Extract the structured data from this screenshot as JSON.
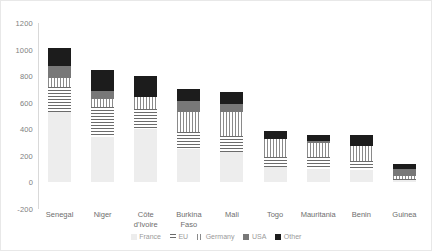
{
  "chart_data": {
    "type": "bar",
    "subtype": "stacked-bar",
    "title": "",
    "xlabel": "",
    "ylabel": "",
    "ylim": [
      -200,
      1200
    ],
    "yticks": [
      1200,
      1000,
      800,
      600,
      400,
      200,
      0,
      -200
    ],
    "grid": false,
    "legend_position": "bottom",
    "categories": [
      "Senegal",
      "Niger",
      "Côte d'Ivoire",
      "Burkina Faso",
      "Mali",
      "Togo",
      "Mauritania",
      "Benin",
      "Guinea"
    ],
    "category_lines": [
      [
        "Senegal"
      ],
      [
        "Niger"
      ],
      [
        "Côte",
        "d'Ivoire"
      ],
      [
        "Burkina",
        "Faso"
      ],
      [
        "Mali"
      ],
      [
        "Togo"
      ],
      [
        "Mauritania"
      ],
      [
        "Benin"
      ],
      [
        "Guinea"
      ]
    ],
    "series": [
      {
        "name": "France",
        "key": "france",
        "values": [
          530,
          340,
          400,
          250,
          230,
          120,
          100,
          95,
          15
        ]
      },
      {
        "name": "EU",
        "key": "eu",
        "values": [
          190,
          230,
          150,
          130,
          120,
          70,
          95,
          65,
          10
        ]
      },
      {
        "name": "Germany",
        "key": "germany",
        "values": [
          70,
          60,
          95,
          150,
          180,
          140,
          100,
          115,
          20
        ]
      },
      {
        "name": "USA",
        "key": "usa",
        "values": [
          90,
          60,
          0,
          85,
          60,
          0,
          15,
          0,
          55
        ]
      },
      {
        "name": "Other",
        "key": "other",
        "values": [
          130,
          155,
          155,
          90,
          90,
          55,
          45,
          80,
          40
        ]
      }
    ],
    "totals": [
      1010,
      845,
      800,
      705,
      680,
      385,
      355,
      355,
      140
    ]
  },
  "legend": {
    "items": [
      {
        "label": "France",
        "key": "france"
      },
      {
        "label": "EU",
        "key": "eu"
      },
      {
        "label": "Germany",
        "key": "germany"
      },
      {
        "label": "USA",
        "key": "usa"
      },
      {
        "label": "Other",
        "key": "other"
      }
    ]
  },
  "colors": {
    "france": "#ededed",
    "eu": "#6b6b6b",
    "germany": "#8a8a8a",
    "usa": "#787878",
    "other": "#1c1c1c",
    "axis_text": "#808080",
    "frame": "#e8e8e8"
  }
}
